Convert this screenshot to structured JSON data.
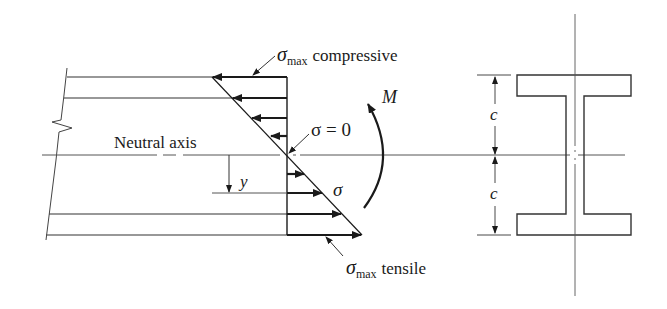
{
  "diagram": {
    "colors": {
      "line": "#1a1a1a",
      "axis": "#555555",
      "background": "#ffffff"
    },
    "labels": {
      "sigma_max_compressive": {
        "symbol": "σ",
        "subscript": "max",
        "text": "compressive"
      },
      "sigma_zero": "σ = 0",
      "moment": "M",
      "neutral_axis": "Neutral axis",
      "y": "y",
      "sigma": "σ",
      "sigma_max_tensile": {
        "symbol": "σ",
        "subscript": "max",
        "text": "tensile"
      },
      "c_top": "c",
      "c_bottom": "c"
    },
    "elements": {
      "beam_side_view": "Beam with flange lines and break mark on left",
      "stress_triangle": "Linear stress distribution: compressive arrows (left) above neutral axis, tensile arrows (right) below",
      "moment_arrow": "Curved arrow showing bending moment M",
      "cross_section": "I-beam cross-section with dimension c above and below neutral axis"
    }
  }
}
